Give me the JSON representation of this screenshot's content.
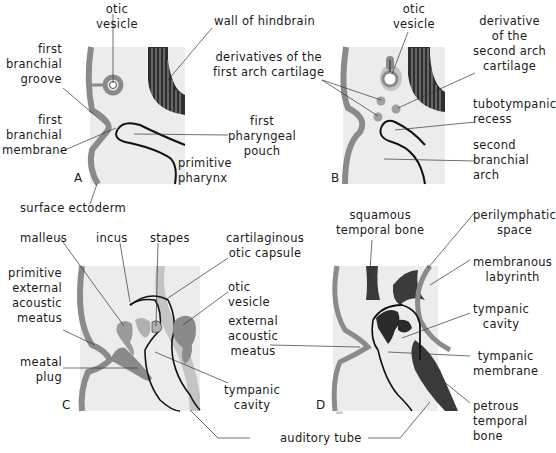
{
  "figure": {
    "panels": {
      "A": {
        "letter": "A",
        "labels": {
          "otic_vesicle": "otic\nvesicle",
          "wall_of_hindbrain": "wall of hindbrain",
          "first_branchial_groove": "first\nbranchial\ngroove",
          "first_branchial_membrane": "first\nbranchial\nmembrane",
          "first_pharyngeal_pouch": "first\npharyngeal\npouch",
          "primitive_pharynx": "primitive\npharynx",
          "surface_ectoderm": "surface ectoderm"
        }
      },
      "B": {
        "letter": "B",
        "labels": {
          "otic_vesicle": "otic\nvesicle",
          "derivatives_first_arch": "derivatives of the\nfirst arch cartilage",
          "derivative_second_arch": "derivative\nof the\nsecond arch\ncartilage",
          "tubotympanic_recess": "tubotympanic\nrecess",
          "second_branchial_arch": "second\nbranchial\narch"
        }
      },
      "C": {
        "letter": "C",
        "labels": {
          "malleus": "malleus",
          "incus": "incus",
          "stapes": "stapes",
          "cartilaginous_otic_capsule": "cartilaginous\notic capsule",
          "primitive_external_acoustic_meatus": "primitive\nexternal\nacoustic\nmeatus",
          "otic_vesicle": "otic\nvesicle",
          "meatal_plug": "meatal\nplug",
          "tympanic_cavity": "tympanic\ncavity"
        }
      },
      "D": {
        "letter": "D",
        "signature": "del.",
        "labels": {
          "squamous_temporal_bone": "squamous\ntemporal bone",
          "perilymphatic_space": "perilymphatic\nspace",
          "membranous_labyrinth": "membranous\nlabyrinth",
          "tympanic_cavity": "tympanic\ncavity",
          "tympanic_membrane": "tympanic\nmembrane",
          "petrous_temporal_bone": "petrous\ntemporal\nbone"
        }
      }
    },
    "shared_labels": {
      "external_acoustic_meatus": "external\nacoustic\nmeatus",
      "auditory_tube": "auditory tube"
    },
    "colors": {
      "background": "#ffffff",
      "panel_fill": "#ececec",
      "ectoderm": "#8a8a8a",
      "dark_tissue": "#3a3a3a",
      "medium_tissue": "#9a9a9a",
      "light_tissue": "#c4c4c4",
      "line": "#111111"
    }
  }
}
